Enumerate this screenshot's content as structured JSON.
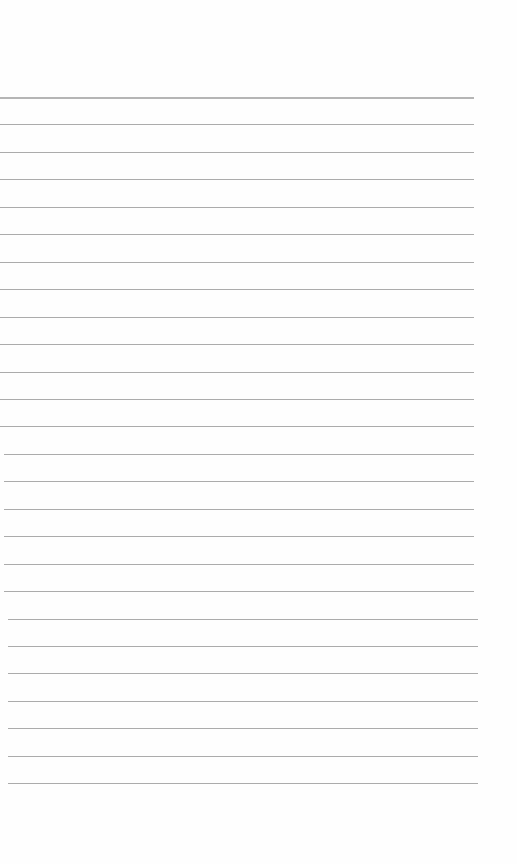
{
  "page": {
    "type": "ruled-notebook-sheet",
    "background_color": "#fefefe",
    "line_color": "#9c9c9c",
    "line_count": 26,
    "first_line_y": 97,
    "line_spacing": 27.45,
    "line_left": 0,
    "line_right": 474,
    "text_content": []
  }
}
